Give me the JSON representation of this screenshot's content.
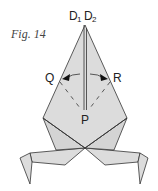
{
  "figure": {
    "caption": "Fig. 14",
    "labels": {
      "d1": "D",
      "d1_sub": "1",
      "d2": "D",
      "d2_sub": "2",
      "q": "Q",
      "r": "R",
      "p": "P"
    },
    "colors": {
      "paper": "#dcdcdc",
      "stroke": "#333333",
      "background": "#ffffff"
    }
  }
}
